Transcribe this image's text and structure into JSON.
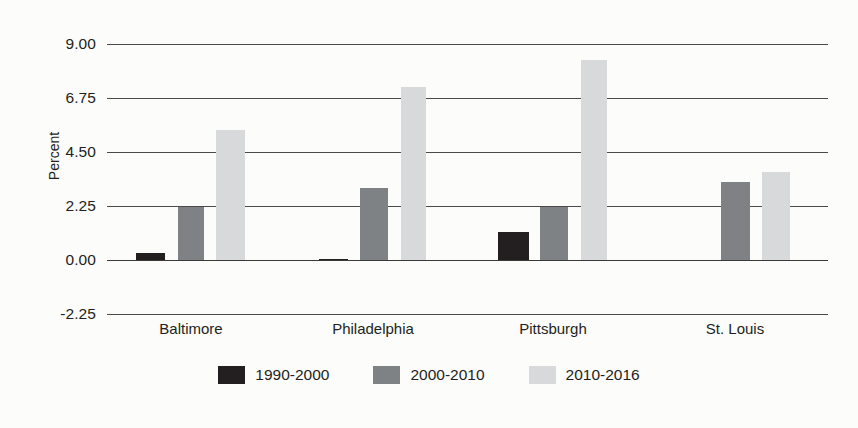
{
  "chart_data": {
    "type": "bar",
    "title": "",
    "subtitle": "",
    "xlabel": "",
    "ylabel": "Percent",
    "categories": [
      "Baltimore",
      "Philadelphia",
      "Pittsburgh",
      "St. Louis"
    ],
    "series": [
      {
        "name": "1990-2000",
        "color": "#231f20",
        "values": [
          0.3,
          0.06,
          1.17,
          0.0
        ]
      },
      {
        "name": "2000-2010",
        "color": "#7f8285",
        "values": [
          2.2,
          3.0,
          2.2,
          3.25
        ]
      },
      {
        "name": "2010-2016",
        "color": "#d8d9da",
        "values": [
          5.42,
          7.21,
          8.33,
          3.67
        ]
      }
    ],
    "ylim": [
      -2.25,
      9.0
    ],
    "yticks": [
      "9.00",
      "6.75",
      "4.50",
      "2.25",
      "0.00",
      "-2.25"
    ],
    "ytick_values": [
      9.0,
      6.75,
      4.5,
      2.25,
      0.0,
      -2.25
    ],
    "grid": true,
    "grid_axis": "y",
    "legend_position": "bottom",
    "background_color": "#fcfcfa",
    "axis_color": "#4a4a4a"
  }
}
